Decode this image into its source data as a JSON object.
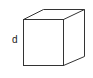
{
  "diagram": {
    "type": "cube",
    "label": "d",
    "stroke_color": "#333333",
    "background": "#ffffff",
    "vertices": {
      "front_top_left": [
        23,
        19
      ],
      "front_top_right": [
        63,
        19
      ],
      "front_bottom_left": [
        23,
        65
      ],
      "front_bottom_right": [
        63,
        65
      ],
      "back_top_left": [
        43,
        9
      ],
      "back_top_right": [
        84,
        9
      ],
      "back_bottom_right": [
        84,
        56
      ]
    }
  }
}
